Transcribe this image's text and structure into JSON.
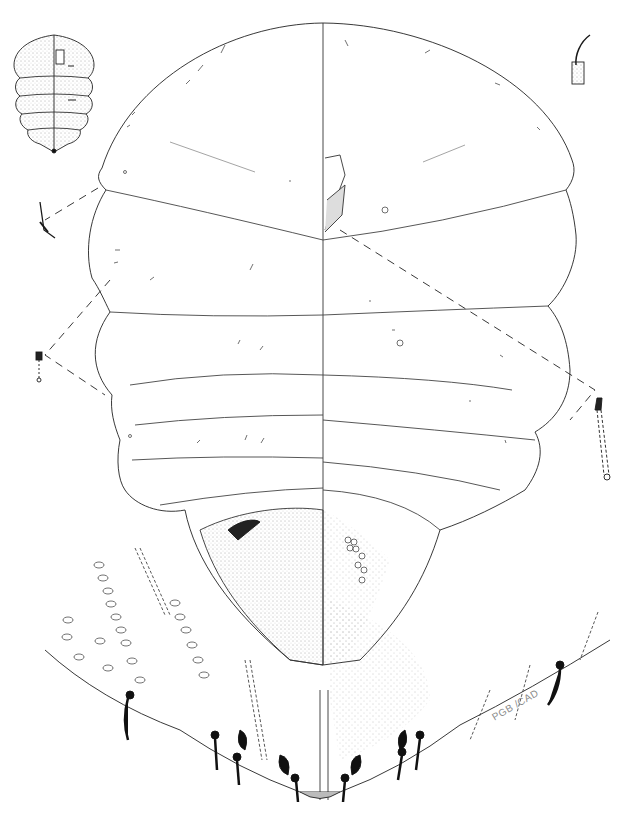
{
  "figure": {
    "ink_color": "#1a1a1a",
    "background": "#ffffff",
    "signature": "PGB /CAD",
    "panels": [
      {
        "id": "habitus-inset",
        "position": "top-left",
        "label": "whole body habitus (stippled)"
      },
      {
        "id": "main-body",
        "position": "center",
        "label": "body outline, left half dorsum / right half venter"
      },
      {
        "id": "antenna-detail",
        "position": "top-right",
        "label": "seta on socket detail"
      },
      {
        "id": "spiracle-detail-left-upper",
        "position": "left",
        "label": "marginal seta detail"
      },
      {
        "id": "pore-detail-left",
        "position": "left-middle",
        "label": "tubular duct detail"
      },
      {
        "id": "duct-detail-right",
        "position": "right-middle",
        "label": "tubular duct detail"
      },
      {
        "id": "anal-lobe-enlargement",
        "position": "bottom",
        "label": "enlarged posterior margin with cerarii"
      }
    ]
  }
}
